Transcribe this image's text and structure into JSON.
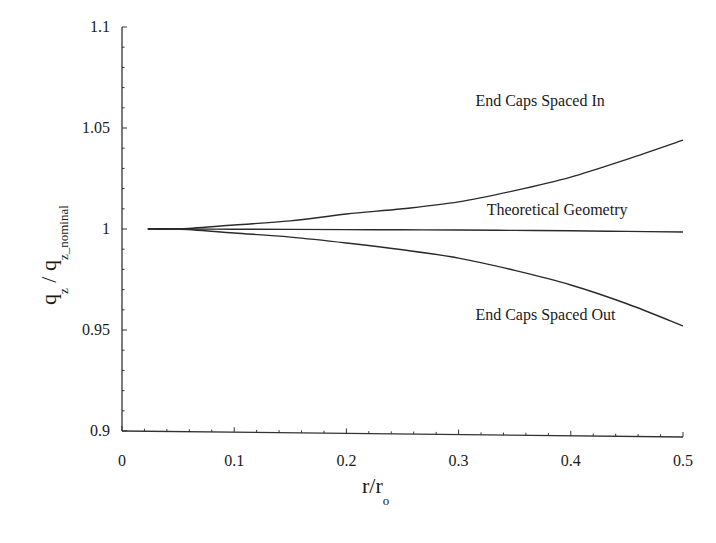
{
  "chart_data": {
    "type": "line",
    "title": "",
    "xlabel": "r/r_o",
    "ylabel": "q_z / q_z_nominal",
    "xlim": [
      0,
      0.5
    ],
    "ylim": [
      0.9,
      1.1
    ],
    "grid": false,
    "legend": "none (inline annotations)",
    "x_ticks": [
      0,
      0.1,
      0.2,
      0.3,
      0.4,
      0.5
    ],
    "x_tick_labels": [
      "0",
      "0.1",
      "0.2",
      "0.3",
      "0.4",
      "0.5"
    ],
    "y_ticks": [
      0.9,
      0.95,
      1.0,
      1.05,
      1.1
    ],
    "y_tick_labels": [
      "0.9",
      "0.95",
      "1",
      "1.05",
      "1.1"
    ],
    "x": [
      0.023,
      0.05,
      0.1,
      0.15,
      0.2,
      0.25,
      0.3,
      0.35,
      0.4,
      0.45,
      0.5
    ],
    "series": [
      {
        "name": "End Caps Spaced In",
        "values": [
          1.0,
          1.0,
          1.002,
          1.004,
          1.0074,
          1.01,
          1.0134,
          1.019,
          1.0257,
          1.0345,
          1.044
        ]
      },
      {
        "name": "Theoretical Geometry",
        "values": [
          1.0,
          1.0,
          0.9999,
          0.9998,
          0.9997,
          0.9996,
          0.9995,
          0.9993,
          0.9991,
          0.9988,
          0.9985
        ]
      },
      {
        "name": "End Caps Spaced Out",
        "values": [
          1.0,
          1.0,
          0.998,
          0.996,
          0.9931,
          0.9897,
          0.9856,
          0.9795,
          0.9723,
          0.963,
          0.952
        ]
      }
    ],
    "annotations": [
      {
        "text": "End Caps Spaced In",
        "x": 0.315,
        "y": 1.061
      },
      {
        "text": "Theoretical Geometry",
        "x": 0.325,
        "y": 1.007
      },
      {
        "text": "End Caps Spaced Out",
        "x": 0.315,
        "y": 0.955
      }
    ]
  },
  "axes": {
    "x_title_main": "r/r",
    "x_title_sub": "o",
    "y_title_q1": "q",
    "y_title_sub1": "z",
    "y_title_slash": " / ",
    "y_title_q2": "q",
    "y_title_sub2": "z_nominal"
  },
  "colors": {
    "line": "#2a2a2a",
    "axis": "#333333",
    "background": "#ffffff"
  }
}
